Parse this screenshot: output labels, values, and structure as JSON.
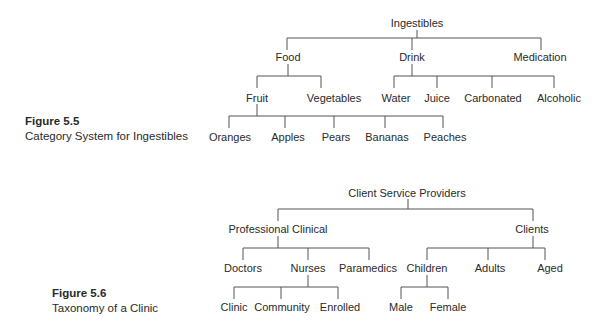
{
  "figures": [
    {
      "number": "Figure 5.5",
      "caption": "Category System for Ingestibles",
      "root": "Ingestibles",
      "level1": [
        "Food",
        "Drink",
        "Medication"
      ],
      "food_children": [
        "Fruit",
        "Vegetables"
      ],
      "drink_children": [
        "Water",
        "Juice",
        "Carbonated",
        "Alcoholic"
      ],
      "fruit_children": [
        "Oranges",
        "Apples",
        "Pears",
        "Bananas",
        "Peaches"
      ]
    },
    {
      "number": "Figure 5.6",
      "caption": "Taxonomy of a Clinic",
      "root": "Client Service Providers",
      "level1": [
        "Professional Clinical",
        "Clients"
      ],
      "professional_children": [
        "Doctors",
        "Nurses",
        "Paramedics"
      ],
      "clients_children": [
        "Children",
        "Adults",
        "Aged"
      ],
      "nurses_children": [
        "Clinic",
        "Community",
        "Enrolled"
      ],
      "children_children": [
        "Male",
        "Female"
      ]
    }
  ],
  "line_color": "#555555"
}
